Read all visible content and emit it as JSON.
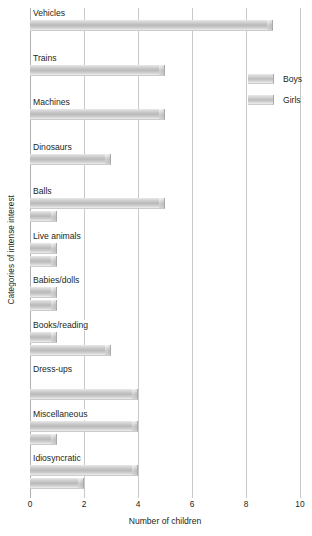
{
  "chart_data": {
    "type": "bar",
    "orientation": "horizontal",
    "title": "",
    "xlabel": "Number of children",
    "ylabel": "Categories of intense interest",
    "xlim": [
      0,
      10
    ],
    "xticks": [
      0,
      2,
      4,
      6,
      8,
      10
    ],
    "grid": true,
    "legend_position": "upper right",
    "categories": [
      "Vehicles",
      "Trains",
      "Machines",
      "Dinosaurs",
      "Balls",
      "Live animals",
      "Babies/dolls",
      "Books/reading",
      "Dress-ups",
      "Miscellaneous",
      "Idiosyncratic"
    ],
    "series": [
      {
        "name": "Boys",
        "values": [
          9,
          5,
          5,
          3,
          5,
          1,
          1,
          1,
          0,
          4,
          4
        ]
      },
      {
        "name": "Girls",
        "values": [
          0,
          0,
          0,
          0,
          1,
          1,
          1,
          3,
          4,
          1,
          2
        ]
      }
    ]
  },
  "legend": {
    "items": [
      {
        "label": "Boys"
      },
      {
        "label": "Girls"
      }
    ]
  },
  "colors": {
    "bar_light": "#eaeaea",
    "bar_mid": "#bdbdbd",
    "bar_edge": "#a9a9a9",
    "gridline": "#c9c9c9",
    "text": "#231f20",
    "background": "#ffffff"
  }
}
